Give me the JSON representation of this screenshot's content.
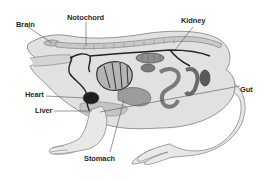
{
  "labels": {
    "brain": "Brain",
    "notochord": "Notochord",
    "kidney": "Kidney",
    "heart": "Heart",
    "liver": "Liver",
    "gut": "Gut",
    "stomach": "Stomach"
  },
  "colors": {
    "background": "#ffffff",
    "body_fill": "#e3e3e3",
    "body_outline": "#8a8a8a",
    "organ_mid": "#a9a9a9",
    "organ_dark": "#6e6e6e",
    "heart": "#1e1e1e",
    "vessel": "#222222",
    "label_text": "#2a2a2a",
    "leader_line": "#555555"
  }
}
